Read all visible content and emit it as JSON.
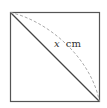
{
  "diagram": {
    "shape": "square",
    "square": {
      "x": 10.5,
      "y": 12.5,
      "size": 89,
      "stroke": "#555555"
    },
    "diagonal": {
      "from": "top-left",
      "to": "bottom-right",
      "stroke": "#444444"
    },
    "arc": {
      "from": "top-left",
      "to": "bottom-right",
      "style": "dashed",
      "stroke": "#aaaaaa"
    },
    "label": {
      "variable": "x",
      "unit": "cm"
    }
  }
}
